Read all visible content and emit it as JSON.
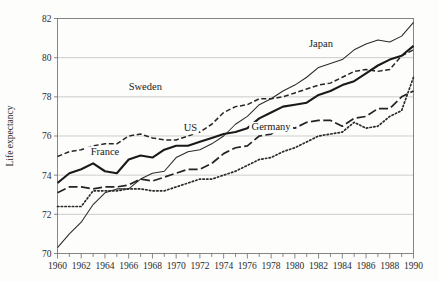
{
  "figure": {
    "width": 439,
    "height": 282,
    "background": "#fdfdfc",
    "ink": "#1a1a1a"
  },
  "chart_data": {
    "type": "line",
    "title": "",
    "xlabel": "",
    "ylabel": "Life expectancy",
    "xlim": [
      1960,
      1990
    ],
    "ylim": [
      70,
      82
    ],
    "yticks": [
      70,
      72,
      74,
      76,
      78,
      80,
      82
    ],
    "ytick_labels": [
      "70",
      "72",
      "74",
      "76",
      "78",
      "80",
      "82"
    ],
    "xticks": [
      1960,
      1962,
      1964,
      1966,
      1968,
      1970,
      1972,
      1974,
      1976,
      1978,
      1980,
      1982,
      1984,
      1986,
      1988,
      1990
    ],
    "xtick_labels": [
      "1960",
      "1962",
      "1964",
      "1966",
      "1968",
      "1970",
      "1972",
      "1974",
      "1976",
      "1978",
      "1980",
      "1982",
      "1984",
      "1986",
      "1988",
      "1990"
    ],
    "minor_xtick_step": 1,
    "grid": "horizontal",
    "legend": "inline-labels",
    "x": [
      1960,
      1961,
      1962,
      1963,
      1964,
      1965,
      1966,
      1967,
      1968,
      1969,
      1970,
      1971,
      1972,
      1973,
      1974,
      1975,
      1976,
      1977,
      1978,
      1979,
      1980,
      1981,
      1982,
      1983,
      1984,
      1985,
      1986,
      1987,
      1988,
      1989,
      1990
    ],
    "series": [
      {
        "name": "Japan",
        "style": "thin-solid",
        "color": "#2a2a2a",
        "label_x": 1982.2,
        "label_y": 80.55,
        "values": [
          70.3,
          71.0,
          71.6,
          72.5,
          73.1,
          73.3,
          73.3,
          73.8,
          74.1,
          74.2,
          74.9,
          75.2,
          75.3,
          75.6,
          76.0,
          76.6,
          77.0,
          77.6,
          77.9,
          78.3,
          78.6,
          79.0,
          79.5,
          79.7,
          79.9,
          80.4,
          80.7,
          80.9,
          80.8,
          81.1,
          81.8
        ]
      },
      {
        "name": "Sweden",
        "style": "dashed",
        "color": "#262626",
        "label_x": 1967.4,
        "label_y": 78.35,
        "values": [
          74.95,
          75.2,
          75.3,
          75.5,
          75.6,
          75.6,
          76.0,
          76.1,
          75.9,
          75.8,
          75.8,
          76.0,
          76.2,
          76.6,
          77.2,
          77.5,
          77.6,
          77.9,
          77.9,
          78.0,
          78.2,
          78.4,
          78.6,
          78.7,
          79.0,
          79.3,
          79.4,
          79.3,
          79.4,
          80.1,
          80.4
        ]
      },
      {
        "name": "France",
        "style": "thick-solid",
        "color": "#1a1a1a",
        "label_x": 1964.0,
        "label_y": 75.05,
        "values": [
          73.6,
          74.1,
          74.3,
          74.6,
          74.2,
          74.1,
          74.8,
          75.0,
          74.9,
          75.3,
          75.5,
          75.5,
          75.7,
          75.9,
          76.1,
          76.2,
          76.4,
          76.9,
          77.2,
          77.5,
          77.6,
          77.7,
          78.1,
          78.3,
          78.6,
          78.8,
          79.2,
          79.6,
          79.9,
          80.1,
          80.6
        ]
      },
      {
        "name": "US",
        "style": "long-dash",
        "color": "#242424",
        "label_x": 1971.2,
        "label_y": 76.25,
        "values": [
          73.1,
          73.4,
          73.4,
          73.3,
          73.4,
          73.4,
          73.5,
          73.8,
          73.7,
          73.9,
          74.1,
          74.3,
          74.3,
          74.6,
          75.1,
          75.4,
          75.5,
          76.0,
          76.1,
          76.5,
          76.4,
          76.7,
          76.8,
          76.8,
          76.5,
          76.9,
          77.0,
          77.4,
          77.4,
          78.0,
          78.3
        ]
      },
      {
        "name": "Germany",
        "style": "dotted",
        "color": "#2a2a2a",
        "label_x": 1978.0,
        "label_y": 76.3,
        "values": [
          72.4,
          72.4,
          72.4,
          73.2,
          73.2,
          73.2,
          73.3,
          73.3,
          73.2,
          73.2,
          73.4,
          73.6,
          73.8,
          73.8,
          74.0,
          74.2,
          74.5,
          74.8,
          74.9,
          75.2,
          75.4,
          75.7,
          76.0,
          76.1,
          76.2,
          76.7,
          76.4,
          76.5,
          77.0,
          77.3,
          79.0
        ]
      }
    ]
  }
}
